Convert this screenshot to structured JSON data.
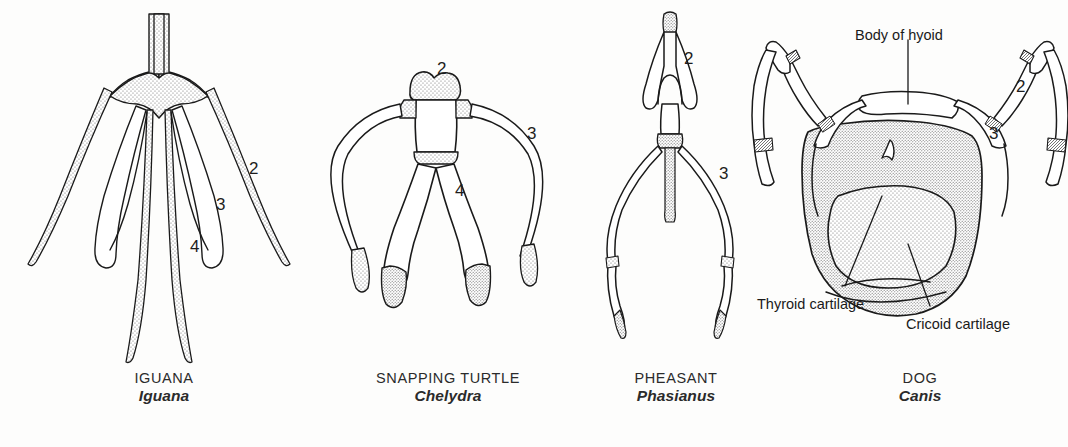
{
  "figure": {
    "type": "comparative-anatomy-plate",
    "background_color": "#fdfdfc",
    "ink_color": "#1a1a1a",
    "stipple_color": "#6f6f6f"
  },
  "panels": [
    {
      "id": "iguana",
      "common_name": "IGUANA",
      "genus": "Iguana",
      "numbers": [
        {
          "label": "2",
          "x": 249,
          "y": 160
        },
        {
          "label": "3",
          "x": 216,
          "y": 196
        },
        {
          "label": "4",
          "x": 190,
          "y": 238
        }
      ]
    },
    {
      "id": "snapping-turtle",
      "common_name": "SNAPPING TURTLE",
      "genus": "Chelydra",
      "numbers": [
        {
          "label": "2",
          "x": 437,
          "y": 60
        },
        {
          "label": "3",
          "x": 527,
          "y": 125
        },
        {
          "label": "4",
          "x": 455,
          "y": 182
        }
      ]
    },
    {
      "id": "pheasant",
      "common_name": "PHEASANT",
      "genus": "Phasianus",
      "numbers": [
        {
          "label": "2",
          "x": 684,
          "y": 50
        },
        {
          "label": "3",
          "x": 719,
          "y": 165
        }
      ]
    },
    {
      "id": "dog",
      "common_name": "DOG",
      "genus": "Canis",
      "numbers": [
        {
          "label": "2",
          "x": 1016,
          "y": 78
        },
        {
          "label": "3",
          "x": 989,
          "y": 125
        }
      ]
    }
  ],
  "annotations": [
    {
      "id": "body-of-hyoid",
      "text": "Body of hyoid",
      "x": 855,
      "y": 28
    },
    {
      "id": "thyroid-cartilage",
      "text": "Thyroid cartilage",
      "x": 757,
      "y": 297
    },
    {
      "id": "cricoid-cartilage",
      "text": "Cricoid cartilage",
      "x": 906,
      "y": 317
    }
  ],
  "captions": [
    {
      "id": "iguana",
      "common": "IGUANA",
      "genus": "Iguana",
      "cx": 164,
      "y": 370
    },
    {
      "id": "snapping-turtle",
      "common": "SNAPPING TURTLE",
      "genus": "Chelydra",
      "cx": 448,
      "y": 370
    },
    {
      "id": "pheasant",
      "common": "PHEASANT",
      "genus": "Phasianus",
      "cx": 676,
      "y": 370
    },
    {
      "id": "dog",
      "common": "DOG",
      "genus": "Canis",
      "cx": 920,
      "y": 370
    }
  ]
}
